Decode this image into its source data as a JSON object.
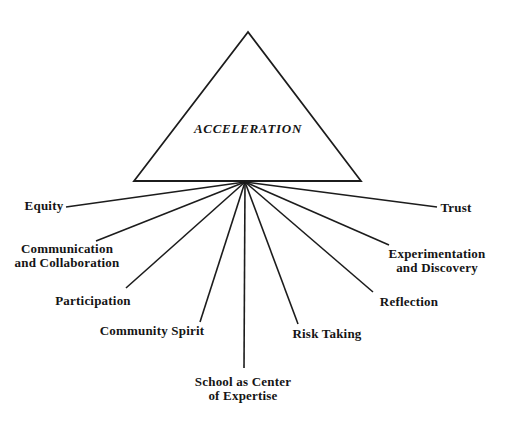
{
  "figure": {
    "type": "radial-concept-diagram",
    "title": "ACCELERATION",
    "background_color": "#ffffff",
    "line_color": "#1c1c1c",
    "text_color": "#151515"
  },
  "nodes": [
    {
      "id": "equity",
      "label": "Equity"
    },
    {
      "id": "communication-and-collaboration",
      "label": "Communication\nand Collaboration"
    },
    {
      "id": "participation",
      "label": "Participation"
    },
    {
      "id": "community-spirit",
      "label": "Community Spirit"
    },
    {
      "id": "school-as-center-of-expertise",
      "label": "School as Center\nof Expertise"
    },
    {
      "id": "risk-taking",
      "label": "Risk Taking"
    },
    {
      "id": "reflection",
      "label": "Reflection"
    },
    {
      "id": "experimentation-and-discovery",
      "label": "Experimentation\nand Discovery"
    },
    {
      "id": "trust",
      "label": "Trust"
    }
  ]
}
